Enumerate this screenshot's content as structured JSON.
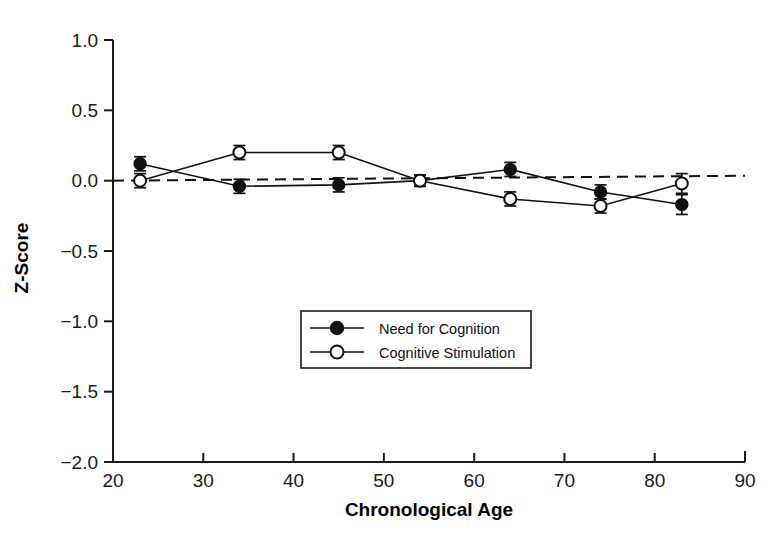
{
  "chart_data": {
    "type": "line",
    "title": "",
    "xlabel": "Chronological Age",
    "ylabel": "Z-Score",
    "xlim": [
      20,
      90
    ],
    "ylim": [
      -2.0,
      1.0
    ],
    "xticks": [
      20,
      30,
      40,
      50,
      60,
      70,
      80,
      90
    ],
    "xtick_labels": [
      "20",
      "30",
      "40",
      "50",
      "60",
      "70",
      "80",
      "90"
    ],
    "yticks": [
      1.0,
      0.5,
      0.0,
      -0.5,
      -1.0,
      -1.5,
      -2.0
    ],
    "ytick_labels": [
      "1.0",
      "0.5",
      "0.0",
      "-0.5",
      "-1.0",
      "-1.5",
      "-2.0"
    ],
    "grid": false,
    "legend_position": "lower-center",
    "reference_line": {
      "label": "zero-reference",
      "style": "dashed",
      "x": [
        20,
        90
      ],
      "y": [
        0.0,
        0.035
      ]
    },
    "x": [
      23,
      34,
      45,
      54,
      64,
      74,
      83
    ],
    "series": [
      {
        "name": "Need for Cognition",
        "marker": "filled-circle",
        "values": [
          0.12,
          -0.04,
          -0.03,
          0.0,
          0.08,
          -0.08,
          -0.17
        ],
        "errors": [
          0.05,
          0.05,
          0.05,
          0.04,
          0.05,
          0.05,
          0.07
        ]
      },
      {
        "name": "Cognitive Stimulation",
        "marker": "open-circle",
        "values": [
          0.0,
          0.2,
          0.2,
          0.0,
          -0.13,
          -0.18,
          -0.02
        ],
        "errors": [
          0.05,
          0.05,
          0.05,
          0.04,
          0.05,
          0.05,
          0.07
        ]
      }
    ]
  },
  "legend": {
    "items": [
      {
        "label": "Need for Cognition",
        "marker": "filled-circle"
      },
      {
        "label": "Cognitive Stimulation",
        "marker": "open-circle"
      }
    ]
  }
}
